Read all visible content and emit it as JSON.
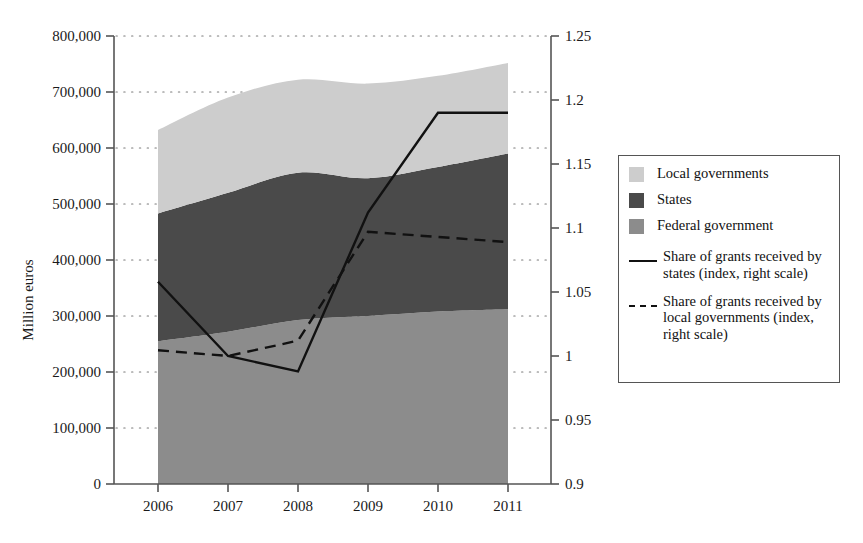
{
  "chart_data": {
    "type": "area",
    "title": "",
    "xlabel": "",
    "ylabel": "Million euros",
    "categories": [
      "2006",
      "2007",
      "2008",
      "2009",
      "2010",
      "2011"
    ],
    "x_tick_labels": [
      "2006",
      "2007",
      "2008",
      "2009",
      "2010",
      "2011"
    ],
    "left_axis": {
      "label": "Million euros",
      "ylim": [
        0,
        800000
      ],
      "tick_values": [
        0,
        100000,
        200000,
        300000,
        400000,
        500000,
        600000,
        700000,
        800000
      ],
      "tick_labels": [
        "0",
        "100,000",
        "200,000",
        "300,000",
        "400,000",
        "500,000",
        "600,000",
        "700,000",
        "800,000"
      ]
    },
    "right_axis": {
      "label": "index",
      "ylim": [
        0.9,
        1.25
      ],
      "tick_values": [
        0.9,
        0.95,
        1,
        1.05,
        1.1,
        1.15,
        1.2,
        1.25
      ],
      "tick_labels": [
        "0.9",
        "0.95",
        "1",
        "1.05",
        "1.1",
        "1.15",
        "1.2",
        "1.25"
      ]
    },
    "grid": "dotted-horizontal",
    "legend_position": "right",
    "stacked_series": [
      {
        "name": "Federal government",
        "color": "#8c8c8c",
        "axis": "left",
        "values": [
          255000,
          272000,
          293000,
          300000,
          308000,
          312000
        ]
      },
      {
        "name": "States",
        "color": "#4a4a4a",
        "axis": "left",
        "values": [
          228000,
          248000,
          263000,
          246000,
          258000,
          278000
        ]
      },
      {
        "name": "Local governments",
        "color": "#cdcdcd",
        "axis": "left",
        "values": [
          149000,
          170000,
          166000,
          169000,
          163000,
          162000
        ]
      }
    ],
    "stack_tops": {
      "federal": [
        255000,
        272000,
        293000,
        300000,
        308000,
        312000
      ],
      "federal_plus_states": [
        483000,
        520000,
        556000,
        546000,
        566000,
        590000
      ],
      "total": [
        632000,
        690000,
        722000,
        715000,
        729000,
        752000
      ]
    },
    "line_series": [
      {
        "name": "Share of grants received by states (index, right scale)",
        "style": "solid",
        "color": "#111111",
        "axis": "right",
        "values": [
          1.058,
          1.0,
          0.988,
          1.112,
          1.19,
          1.19
        ]
      },
      {
        "name": "Share of grants received by local governments (index, right scale)",
        "style": "dashed",
        "color": "#111111",
        "axis": "right",
        "values": [
          1.0045,
          1.0,
          1.012,
          1.097,
          1.093,
          1.089
        ]
      }
    ]
  },
  "legend": {
    "items": [
      {
        "label": "Local governments",
        "marker": "swatch",
        "color": "#cdcdcd"
      },
      {
        "label": "States",
        "marker": "swatch",
        "color": "#4a4a4a"
      },
      {
        "label": "Federal government",
        "marker": "swatch",
        "color": "#8c8c8c"
      },
      {
        "label": "Share of grants received by states (index, right scale)",
        "marker": "solid-line",
        "color": "#111111"
      },
      {
        "label": "Share of grants received by local governments (index, right scale)",
        "marker": "dashed-line",
        "color": "#111111"
      }
    ]
  },
  "axis_titles": {
    "left": "Million euros"
  }
}
